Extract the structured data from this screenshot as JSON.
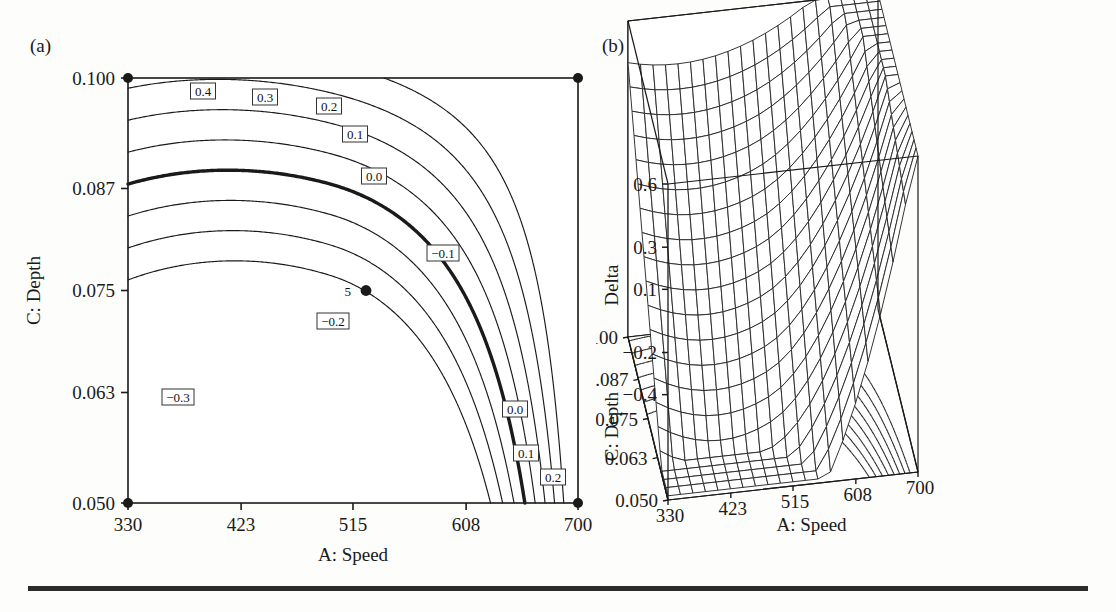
{
  "figure": {
    "panel_a_label": "(a)",
    "panel_b_label": "(b)",
    "design_point": {
      "label": "5",
      "x": 515,
      "y": 0.075
    }
  },
  "chart_data": [
    {
      "type": "contour",
      "panel": "(a)",
      "title": "",
      "xlabel": "A: Speed",
      "ylabel": "C: Depth",
      "zlabel": "Delta",
      "xlim": [
        330,
        700
      ],
      "ylim": [
        0.05,
        0.1
      ],
      "xticks": [
        330,
        423,
        515,
        608,
        700
      ],
      "xtick_labels": [
        "330",
        "423",
        "515",
        "608",
        "700"
      ],
      "yticks": [
        0.1,
        0.087,
        0.075,
        0.063,
        0.05
      ],
      "ytick_labels": [
        "0.100",
        "0.087",
        "0.075",
        "0.063",
        "0.050"
      ],
      "grid": false,
      "contour_levels": [
        0.4,
        0.3,
        0.2,
        0.1,
        0.0,
        -0.1,
        -0.2,
        -0.3
      ],
      "highlighted_level": 0.0,
      "contour_labels": [
        {
          "text": "0.4",
          "level": 0.4,
          "x": 203,
          "y": 91
        },
        {
          "text": "0.3",
          "level": 0.3,
          "x": 265,
          "y": 97
        },
        {
          "text": "0.2",
          "level": 0.2,
          "x": 329,
          "y": 106
        },
        {
          "text": "0.1",
          "level": 0.1,
          "x": 355,
          "y": 134
        },
        {
          "text": "0.0",
          "level": 0.0,
          "x": 374,
          "y": 176
        },
        {
          "text": "-0.1",
          "level": -0.1,
          "x": 443,
          "y": 253
        },
        {
          "text": "-0.2",
          "level": -0.2,
          "x": 333,
          "y": 321
        },
        {
          "text": "-0.3",
          "level": -0.3,
          "x": 178,
          "y": 397
        },
        {
          "text": "0.0",
          "level": 0.0,
          "x": 515,
          "y": 409
        },
        {
          "text": "0.1",
          "level": 0.1,
          "x": 526,
          "y": 453
        },
        {
          "text": "0.2",
          "level": 0.2,
          "x": 553,
          "y": 477
        }
      ],
      "corner_markers": [
        {
          "x": 330,
          "y": 0.1
        },
        {
          "x": 700,
          "y": 0.1
        },
        {
          "x": 330,
          "y": 0.05
        },
        {
          "x": 700,
          "y": 0.05
        }
      ]
    },
    {
      "type": "surface",
      "panel": "(b)",
      "title": "",
      "xlabel": "A: Speed",
      "ylabel": "C: Depth",
      "zlabel": "Delta",
      "xlim": [
        330,
        700
      ],
      "ylim": [
        0.05,
        0.1
      ],
      "zlim": [
        -0.9,
        0.6
      ],
      "xticks": [
        330,
        423,
        515,
        608,
        700
      ],
      "xtick_labels": [
        "330",
        "423",
        "515",
        "608",
        "700"
      ],
      "yticks": [
        0.1,
        0.087,
        0.075,
        0.063,
        0.05
      ],
      "ytick_labels": [
        "0.100",
        "0.087",
        "0.075",
        "0.063",
        "0.050"
      ],
      "zticks": [
        0.6,
        0.3,
        0.1,
        -0.2,
        -0.4
      ],
      "ztick_labels": [
        "0.6",
        "0.3",
        "0.1",
        "-0.2",
        "-0.4"
      ],
      "mesh_nx": 20,
      "mesh_ny": 20,
      "floor_contours": true,
      "grid": false
    }
  ]
}
